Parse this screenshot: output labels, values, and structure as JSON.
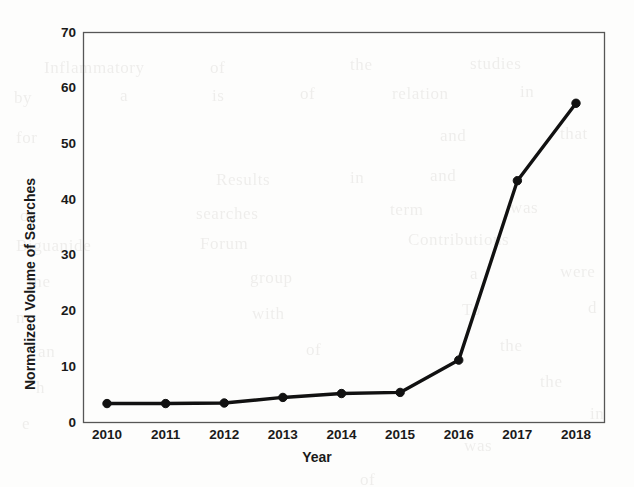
{
  "chart_data": {
    "type": "line",
    "title": "",
    "subtitle": "",
    "xlabel": "Year",
    "ylabel": "Normalized Volume of Searches",
    "categories": [
      "2010",
      "2011",
      "2012",
      "2013",
      "2014",
      "2015",
      "2016",
      "2017",
      "2018"
    ],
    "x": [
      2010,
      2011,
      2012,
      2013,
      2014,
      2015,
      2016,
      2017,
      2018
    ],
    "values": [
      3.4,
      3.4,
      3.5,
      4.5,
      5.2,
      5.4,
      11.2,
      43.4,
      57.3
    ],
    "series": [
      {
        "name": "Normalized Volume of Searches",
        "values": [
          3.4,
          3.4,
          3.5,
          4.5,
          5.2,
          5.4,
          11.2,
          43.4,
          57.3
        ],
        "color": "#111111",
        "marker": "circle"
      }
    ],
    "ylim": [
      0,
      70
    ],
    "yticks": [
      0,
      10,
      20,
      30,
      40,
      50,
      60,
      70
    ],
    "ytick_labels": [
      "0",
      "10",
      "20",
      "30",
      "40",
      "50",
      "60",
      "70"
    ],
    "xtick_labels": [
      "2010",
      "2011",
      "2012",
      "2013",
      "2014",
      "2015",
      "2016",
      "2017",
      "2018"
    ],
    "grid": false,
    "legend": false,
    "legend_position": "none",
    "frame": "box",
    "line_color": "#111111",
    "axis_color": "#565656",
    "background_color": "#fdfdfc",
    "annotations": []
  },
  "axes": {
    "y_title": "Normalized Volume of Searches",
    "x_title": "Year"
  },
  "ghost_text": [
    {
      "text": "Inflammatory",
      "x": 44,
      "y": 58
    },
    {
      "text": "of",
      "x": 210,
      "y": 58
    },
    {
      "text": "the",
      "x": 350,
      "y": 55
    },
    {
      "text": "studies",
      "x": 470,
      "y": 54
    },
    {
      "text": "by",
      "x": 14,
      "y": 88
    },
    {
      "text": "a",
      "x": 120,
      "y": 86
    },
    {
      "text": "is",
      "x": 212,
      "y": 86
    },
    {
      "text": "of",
      "x": 300,
      "y": 84
    },
    {
      "text": "relation",
      "x": 392,
      "y": 84
    },
    {
      "text": "in",
      "x": 520,
      "y": 82
    },
    {
      "text": "for",
      "x": 16,
      "y": 128
    },
    {
      "text": "and",
      "x": 440,
      "y": 126
    },
    {
      "text": "that",
      "x": 560,
      "y": 124
    },
    {
      "text": "Results",
      "x": 216,
      "y": 170
    },
    {
      "text": "in",
      "x": 350,
      "y": 168
    },
    {
      "text": "and",
      "x": 430,
      "y": 166
    },
    {
      "text": "of",
      "x": 20,
      "y": 206
    },
    {
      "text": "searches",
      "x": 196,
      "y": 204
    },
    {
      "text": "term",
      "x": 390,
      "y": 200
    },
    {
      "text": "was",
      "x": 510,
      "y": 198
    },
    {
      "text": "Biguanide",
      "x": 16,
      "y": 236
    },
    {
      "text": "Forum",
      "x": 200,
      "y": 234
    },
    {
      "text": "Contributions",
      "x": 408,
      "y": 230
    },
    {
      "text": "the",
      "x": 28,
      "y": 272
    },
    {
      "text": "group",
      "x": 250,
      "y": 268
    },
    {
      "text": "a",
      "x": 470,
      "y": 264
    },
    {
      "text": "were",
      "x": 560,
      "y": 262
    },
    {
      "text": "n",
      "x": 16,
      "y": 308
    },
    {
      "text": "with",
      "x": 252,
      "y": 304
    },
    {
      "text": "To",
      "x": 462,
      "y": 300
    },
    {
      "text": "d",
      "x": 588,
      "y": 298
    },
    {
      "text": "an",
      "x": 38,
      "y": 342
    },
    {
      "text": "of",
      "x": 306,
      "y": 340
    },
    {
      "text": "the",
      "x": 500,
      "y": 336
    },
    {
      "text": "the",
      "x": 540,
      "y": 372
    },
    {
      "text": "h",
      "x": 36,
      "y": 378
    },
    {
      "text": "in",
      "x": 590,
      "y": 404
    },
    {
      "text": "e",
      "x": 22,
      "y": 414
    },
    {
      "text": "was",
      "x": 464,
      "y": 436
    },
    {
      "text": "of",
      "x": 360,
      "y": 470
    }
  ]
}
